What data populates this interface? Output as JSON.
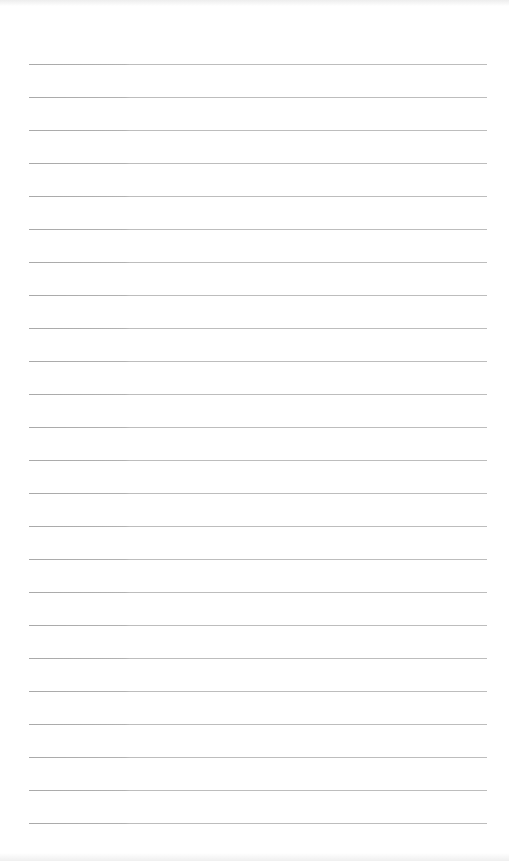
{
  "document": {
    "type": "lined-paper",
    "line_count": 24,
    "first_line_y": 64,
    "line_spacing": 33,
    "line_left": 29,
    "line_width": 458,
    "colors": {
      "paper": "#ffffff",
      "rule": "#bdbdbd"
    },
    "lines": [
      {
        "text": ""
      },
      {
        "text": ""
      },
      {
        "text": ""
      },
      {
        "text": ""
      },
      {
        "text": ""
      },
      {
        "text": ""
      },
      {
        "text": ""
      },
      {
        "text": ""
      },
      {
        "text": ""
      },
      {
        "text": ""
      },
      {
        "text": ""
      },
      {
        "text": ""
      },
      {
        "text": ""
      },
      {
        "text": ""
      },
      {
        "text": ""
      },
      {
        "text": ""
      },
      {
        "text": ""
      },
      {
        "text": ""
      },
      {
        "text": ""
      },
      {
        "text": ""
      },
      {
        "text": ""
      },
      {
        "text": ""
      },
      {
        "text": ""
      },
      {
        "text": ""
      }
    ]
  }
}
